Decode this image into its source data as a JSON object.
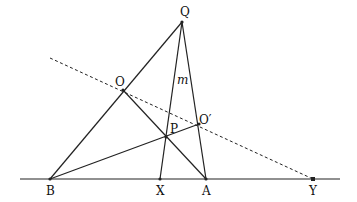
{
  "diagram": {
    "type": "geometry",
    "points": {
      "Q": {
        "label": "Q",
        "x": 182,
        "y": 22
      },
      "O": {
        "label": "O",
        "x": 123,
        "y": 90
      },
      "P": {
        "label": "P",
        "x": 166,
        "y": 137
      },
      "O_prime": {
        "label": "O′",
        "x": 199,
        "y": 124
      },
      "B": {
        "label": "B",
        "x": 50,
        "y": 179
      },
      "X": {
        "label": "X",
        "x": 160,
        "y": 179
      },
      "A": {
        "label": "A",
        "x": 206,
        "y": 179
      },
      "Y": {
        "label": "Y",
        "x": 313,
        "y": 179
      }
    },
    "line_labels": {
      "m": "m"
    },
    "segments": [
      {
        "from": "B",
        "to": "Q",
        "style": "solid"
      },
      {
        "from": "Q",
        "to": "A",
        "style": "solid"
      },
      {
        "from": "Q",
        "to": "X",
        "style": "solid",
        "name": "m"
      },
      {
        "from": "O",
        "to": "A",
        "style": "solid"
      },
      {
        "from": "B",
        "to": "O_prime",
        "style": "solid"
      },
      {
        "from": "baseline_start",
        "to": "baseline_end",
        "style": "solid"
      },
      {
        "from": "dashed_start",
        "to": "Y",
        "style": "dashed"
      }
    ],
    "colors": {
      "stroke": "#222222",
      "background": "#ffffff"
    }
  }
}
